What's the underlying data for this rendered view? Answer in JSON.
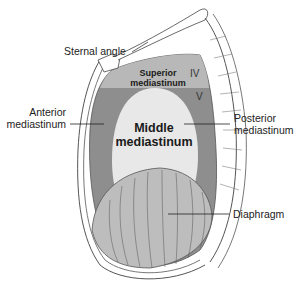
{
  "figure": {
    "colors": {
      "superior_region": "#b8b8b8",
      "outer_mediastinum": "#8e8e8e",
      "middle_region": "#e8e8e8",
      "diaphragm": "#bdbdbd",
      "bone_outline": "#555555",
      "background": "#ffffff"
    }
  },
  "labels": {
    "sternal_angle": "Sternal angle",
    "anterior_line1": "Anterior",
    "anterior_line2": "mediastinum",
    "posterior_line1": "Posterior",
    "posterior_line2": "mediastinum",
    "diaphragm": "Diaphragm"
  },
  "regions": {
    "superior_line1": "Superior",
    "superior_line2": "mediastinum",
    "middle_line1": "Middle",
    "middle_line2": "mediastinum"
  },
  "vertebrae": {
    "iv": "IV",
    "v": "V"
  }
}
